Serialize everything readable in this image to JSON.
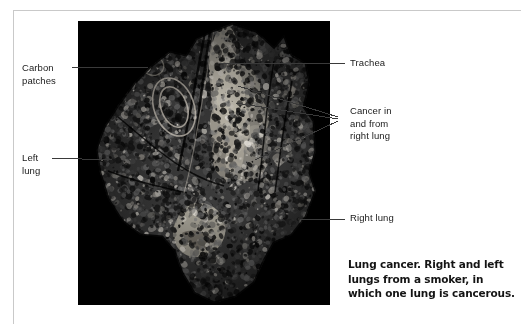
{
  "figure": {
    "type": "anatomical-photograph",
    "background_color": "#000000",
    "page_background": "#ffffff",
    "frame_color": "#c9c9c9",
    "text_color": "#1a1a1a",
    "leader_line_color": "#3a3a3a"
  },
  "labels": {
    "carbon_patches": "Carbon\npatches",
    "left_lung": "Left\nlung",
    "trachea": "Trachea",
    "cancer": "Cancer in\nand from\nright lung",
    "right_lung": "Right lung"
  },
  "caption": {
    "text": "Lung cancer. Right and left lungs from a smoker, in which one lung is cancerous."
  },
  "leader_lines": [
    {
      "name": "carbon-patches-leader",
      "x1": 72,
      "y1": 67,
      "x2": 148,
      "y2": 67
    },
    {
      "name": "left-lung-leader",
      "x1": 52,
      "y1": 158,
      "x2": 112,
      "y2": 160
    },
    {
      "name": "trachea-leader",
      "x1": 345,
      "y1": 63,
      "x2": 218,
      "y2": 63
    },
    {
      "name": "cancer-leader-1",
      "x1": 338,
      "y1": 117,
      "x2": 238,
      "y2": 86
    },
    {
      "name": "cancer-leader-2",
      "x1": 338,
      "y1": 119,
      "x2": 236,
      "y2": 103
    },
    {
      "name": "cancer-leader-3",
      "x1": 338,
      "y1": 121,
      "x2": 255,
      "y2": 160
    },
    {
      "name": "right-lung-leader",
      "x1": 345,
      "y1": 219,
      "x2": 300,
      "y2": 219
    }
  ]
}
